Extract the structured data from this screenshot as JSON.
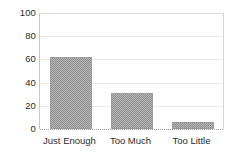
{
  "chart_data": {
    "type": "bar",
    "title": "",
    "subtitle": "",
    "xlabel": "",
    "ylabel": "",
    "categories": [
      "Just Enough",
      "Too Much",
      "Too Little"
    ],
    "values": [
      62,
      31,
      6
    ],
    "ylim": [
      0,
      100
    ],
    "yticks": [
      0,
      20,
      40,
      60,
      80,
      100
    ],
    "ytick_labels": [
      "0",
      "20",
      "40",
      "60",
      "80",
      "100"
    ],
    "grid": true,
    "grid_axis": "y",
    "legend": false,
    "legend_position": "none",
    "bar_fill": "#b9b9b9",
    "bar_pattern": "checkerboard-dither",
    "bar_edge_color": "#9c9c9c",
    "gridline_color": "#e8e8e8",
    "axis_color": "#c8c8c8",
    "text_color": "#2b2b2b",
    "background": "#ffffff"
  },
  "axes": {
    "y": {
      "ticks": [
        {
          "label": "100",
          "value": 100
        },
        {
          "label": "80",
          "value": 80
        },
        {
          "label": "60",
          "value": 60
        },
        {
          "label": "40",
          "value": 40
        },
        {
          "label": "20",
          "value": 20
        },
        {
          "label": "0",
          "value": 0
        }
      ]
    },
    "x": {
      "ticks": [
        {
          "label": "Just Enough"
        },
        {
          "label": "Too Much"
        },
        {
          "label": "Too Little"
        }
      ]
    }
  }
}
